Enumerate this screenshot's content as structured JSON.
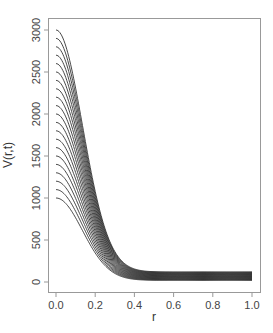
{
  "chart_data": {
    "type": "line",
    "title": "",
    "xlabel": "r",
    "ylabel": "V(r,t)",
    "xlim": [
      0.0,
      1.0
    ],
    "ylim": [
      0,
      3000
    ],
    "xticks": [
      "0.0",
      "0.2",
      "0.4",
      "0.6",
      "0.8",
      "1.0"
    ],
    "yticks": [
      "0",
      "500",
      "1000",
      "1500",
      "2000",
      "2500",
      "3000"
    ],
    "grid": false,
    "legend": null,
    "line_color": "#333333",
    "series_description": "21 curves; V at r=0 ranges from 1000 to 3000 in steps of 100; each decays smoothly to a flat tail between ~20 and ~120 for r >= ~0.45",
    "series": [
      {
        "name": "curve-1",
        "start": 1000,
        "tail": 20
      },
      {
        "name": "curve-2",
        "start": 1100,
        "tail": 25
      },
      {
        "name": "curve-3",
        "start": 1200,
        "tail": 30
      },
      {
        "name": "curve-4",
        "start": 1300,
        "tail": 35
      },
      {
        "name": "curve-5",
        "start": 1400,
        "tail": 40
      },
      {
        "name": "curve-6",
        "start": 1500,
        "tail": 45
      },
      {
        "name": "curve-7",
        "start": 1600,
        "tail": 50
      },
      {
        "name": "curve-8",
        "start": 1700,
        "tail": 55
      },
      {
        "name": "curve-9",
        "start": 1800,
        "tail": 60
      },
      {
        "name": "curve-10",
        "start": 1900,
        "tail": 65
      },
      {
        "name": "curve-11",
        "start": 2000,
        "tail": 70
      },
      {
        "name": "curve-12",
        "start": 2100,
        "tail": 75
      },
      {
        "name": "curve-13",
        "start": 2200,
        "tail": 80
      },
      {
        "name": "curve-14",
        "start": 2300,
        "tail": 85
      },
      {
        "name": "curve-15",
        "start": 2400,
        "tail": 90
      },
      {
        "name": "curve-16",
        "start": 2500,
        "tail": 95
      },
      {
        "name": "curve-17",
        "start": 2600,
        "tail": 100
      },
      {
        "name": "curve-18",
        "start": 2700,
        "tail": 105
      },
      {
        "name": "curve-19",
        "start": 2800,
        "tail": 110
      },
      {
        "name": "curve-20",
        "start": 2900,
        "tail": 115
      },
      {
        "name": "curve-21",
        "start": 3000,
        "tail": 120
      }
    ]
  }
}
